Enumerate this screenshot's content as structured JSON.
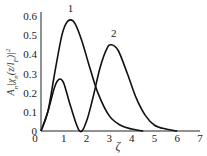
{
  "chart_data": {
    "type": "line",
    "title": "",
    "xlabel": "ζ",
    "ylabel": "A_n|χ_n(z/l_F)|²",
    "xlim": [
      0,
      7
    ],
    "ylim": [
      0,
      0.6
    ],
    "xticks": [
      "0",
      "1",
      "2",
      "3",
      "4",
      "5",
      "6",
      "7"
    ],
    "yticks": [
      "0",
      "0.1",
      "0.2",
      "0.3",
      "0.4",
      "0.5",
      "0.6"
    ],
    "grid": false,
    "legend": "inline curve labels",
    "series": [
      {
        "name": "1",
        "x": [
          0,
          0.3,
          0.6,
          0.9,
          1.1,
          1.3,
          1.5,
          1.8,
          2.1,
          2.5,
          3.0,
          3.5,
          4.0,
          4.5
        ],
        "values": [
          0,
          0.1,
          0.3,
          0.49,
          0.56,
          0.58,
          0.56,
          0.47,
          0.35,
          0.2,
          0.08,
          0.03,
          0.01,
          0
        ]
      },
      {
        "name": "2",
        "x": [
          0,
          0.3,
          0.6,
          0.8,
          1.0,
          1.3,
          1.7,
          2.0,
          2.3,
          2.6,
          2.9,
          3.1,
          3.4,
          3.8,
          4.2,
          4.6,
          5.0,
          5.5,
          6.0
        ],
        "values": [
          0,
          0.1,
          0.23,
          0.27,
          0.25,
          0.13,
          0,
          0.05,
          0.18,
          0.33,
          0.43,
          0.45,
          0.42,
          0.3,
          0.17,
          0.08,
          0.03,
          0.01,
          0
        ]
      }
    ],
    "annotations": [
      {
        "text": "1",
        "x": 1.3,
        "y": 0.62
      },
      {
        "text": "2",
        "x": 3.2,
        "y": 0.49
      }
    ]
  }
}
